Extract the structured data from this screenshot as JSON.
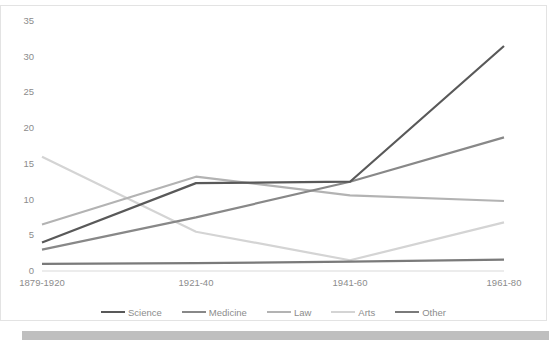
{
  "chart_data": {
    "type": "line",
    "title": "",
    "xlabel": "",
    "ylabel": "",
    "categories": [
      "1879-1920",
      "1921-40",
      "1941-60",
      "1961-80"
    ],
    "ylim": [
      0,
      35
    ],
    "yticks": [
      0,
      5,
      10,
      15,
      20,
      25,
      30,
      35
    ],
    "ytick_labels": [
      "0",
      "5",
      "10",
      "15",
      "20",
      "25",
      "30",
      "35"
    ],
    "grid": false,
    "legend_position": "bottom",
    "series": [
      {
        "name": "Science",
        "values": [
          4.0,
          12.3,
          12.5,
          31.5
        ],
        "color": "#595959"
      },
      {
        "name": "Medicine",
        "values": [
          3.0,
          7.5,
          12.5,
          18.7
        ],
        "color": "#888888"
      },
      {
        "name": "Law",
        "values": [
          6.5,
          13.2,
          10.6,
          9.8
        ],
        "color": "#b3b3b3"
      },
      {
        "name": "Arts",
        "values": [
          16.0,
          5.5,
          1.5,
          6.8
        ],
        "color": "#d4d4d4"
      },
      {
        "name": "Other",
        "values": [
          1.0,
          1.1,
          1.3,
          1.6
        ],
        "color": "#7a7a7a"
      }
    ]
  },
  "axis": {
    "tick_color": "#8c8c8c",
    "baseline_color": "#d9d9d9"
  },
  "frame": {
    "border_color": "#e3e3e3",
    "bottom_bar_color": "#bfbfbf"
  }
}
